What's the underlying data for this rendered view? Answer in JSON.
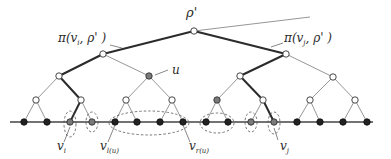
{
  "diagram": {
    "type": "binary-tree",
    "colors": {
      "edge": "#8a8a8a",
      "path_edge": "#2b2b2b",
      "hollow_fill": "#ffffff",
      "black_leaf": "#222222",
      "gray_node": "#7a7a7a",
      "dashed": "#555555"
    },
    "labels": {
      "root": "ρ'",
      "path_left": "π(v",
      "path_left_sub": "i",
      "path_left_tail": ", ρ' )",
      "path_right": "π(v",
      "path_right_sub": "j",
      "path_right_tail": ", ρ' )",
      "u": "u",
      "vi": "v",
      "vi_sub": "i",
      "vl": "v",
      "vl_sub": "l(u)",
      "vr": "v",
      "vr_sub": "r(u)",
      "vj": "v",
      "vj_sub": "j"
    },
    "nodes": {
      "root": {
        "x": 194,
        "y": 31,
        "style": "hollow"
      },
      "level1": [
        {
          "x": 103,
          "y": 54,
          "style": "hollow"
        },
        {
          "x": 286,
          "y": 54,
          "style": "hollow"
        }
      ],
      "level2": [
        {
          "x": 59,
          "y": 76,
          "style": "hollow"
        },
        {
          "x": 149,
          "y": 76,
          "style": "gray",
          "label": "u"
        },
        {
          "x": 240,
          "y": 76,
          "style": "hollow"
        },
        {
          "x": 333,
          "y": 77,
          "style": "hollow"
        }
      ],
      "level3": [
        {
          "x": 36,
          "y": 100,
          "style": "hollow"
        },
        {
          "x": 81,
          "y": 100,
          "style": "hollow"
        },
        {
          "x": 126,
          "y": 100,
          "style": "hollow"
        },
        {
          "x": 172,
          "y": 100,
          "style": "hollow"
        },
        {
          "x": 217,
          "y": 100,
          "style": "gray"
        },
        {
          "x": 263,
          "y": 100,
          "style": "hollow"
        },
        {
          "x": 310,
          "y": 100,
          "style": "hollow"
        },
        {
          "x": 355,
          "y": 100,
          "style": "hollow"
        }
      ],
      "leaves": [
        {
          "x": 24,
          "style": "black"
        },
        {
          "x": 47,
          "style": "black"
        },
        {
          "x": 70,
          "style": "gray",
          "label": "v_i"
        },
        {
          "x": 92,
          "style": "gray"
        },
        {
          "x": 115,
          "style": "black",
          "label": "v_l(u)"
        },
        {
          "x": 137,
          "style": "black"
        },
        {
          "x": 160,
          "style": "black"
        },
        {
          "x": 183,
          "style": "black",
          "label": "v_r(u)"
        },
        {
          "x": 206,
          "style": "black"
        },
        {
          "x": 228,
          "style": "black"
        },
        {
          "x": 251,
          "style": "gray"
        },
        {
          "x": 274,
          "style": "gray",
          "label": "v_j"
        },
        {
          "x": 297,
          "style": "black"
        },
        {
          "x": 320,
          "style": "black"
        },
        {
          "x": 343,
          "style": "black"
        },
        {
          "x": 367,
          "style": "black"
        }
      ],
      "leaf_y": 122
    },
    "baseline": {
      "x1": 10,
      "x2": 373,
      "y": 122
    },
    "groups": [
      {
        "name": "group-vi",
        "cx": 70,
        "cy": 124,
        "rx": 6,
        "ry": 13
      },
      {
        "name": "group-gray-92",
        "cx": 92,
        "cy": 122,
        "rx": 6,
        "ry": 10
      },
      {
        "name": "group-u-subtree",
        "cx": 149,
        "cy": 123,
        "rx": 40,
        "ry": 12
      },
      {
        "name": "group-206-228",
        "cx": 217,
        "cy": 123,
        "rx": 17,
        "ry": 10
      },
      {
        "name": "group-gray-251",
        "cx": 251,
        "cy": 122,
        "rx": 6,
        "ry": 10
      },
      {
        "name": "group-vj",
        "cx": 274,
        "cy": 123,
        "rx": 6,
        "ry": 11
      }
    ]
  }
}
